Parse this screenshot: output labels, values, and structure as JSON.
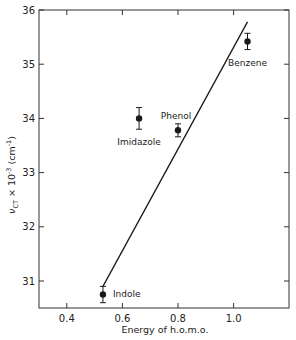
{
  "chart_data": {
    "type": "scatter",
    "title": "",
    "xlabel": "Energy of h.o.m.o.",
    "ylabel": "ν_CT × 10⁻³ (cm⁻¹)",
    "ylabel_parts": {
      "symbol": "ν",
      "sub": "CT",
      "rest": " × 10",
      "exp": "-3",
      "unit": " (cm",
      "unit_exp": "-1",
      "close": ")"
    },
    "xlim": [
      0.3,
      1.2
    ],
    "ylim": [
      30.5,
      36
    ],
    "x_ticks": [
      0.4,
      0.6,
      0.8,
      1.0
    ],
    "x_tick_labels": [
      "0.4",
      "0.6",
      "0.8",
      "1.0"
    ],
    "y_ticks": [
      31,
      32,
      33,
      34,
      35,
      36
    ],
    "y_tick_labels": [
      "31",
      "32",
      "33",
      "34",
      "35",
      "36"
    ],
    "grid": false,
    "legend": null,
    "points": [
      {
        "label": "Indole",
        "x": 0.53,
        "y": 30.75,
        "err": 0.15
      },
      {
        "label": "Imidazole",
        "x": 0.66,
        "y": 34.0,
        "err": 0.2
      },
      {
        "label": "Phenol",
        "x": 0.8,
        "y": 33.78,
        "err": 0.12
      },
      {
        "label": "Benzene",
        "x": 1.05,
        "y": 35.42,
        "err": 0.15
      }
    ],
    "fit_line": {
      "x": [
        0.53,
        1.05
      ],
      "y": [
        30.9,
        35.78
      ]
    }
  },
  "colors": {
    "ink": "#1a1a1a",
    "frame": "#333333",
    "background": "#ffffff"
  }
}
